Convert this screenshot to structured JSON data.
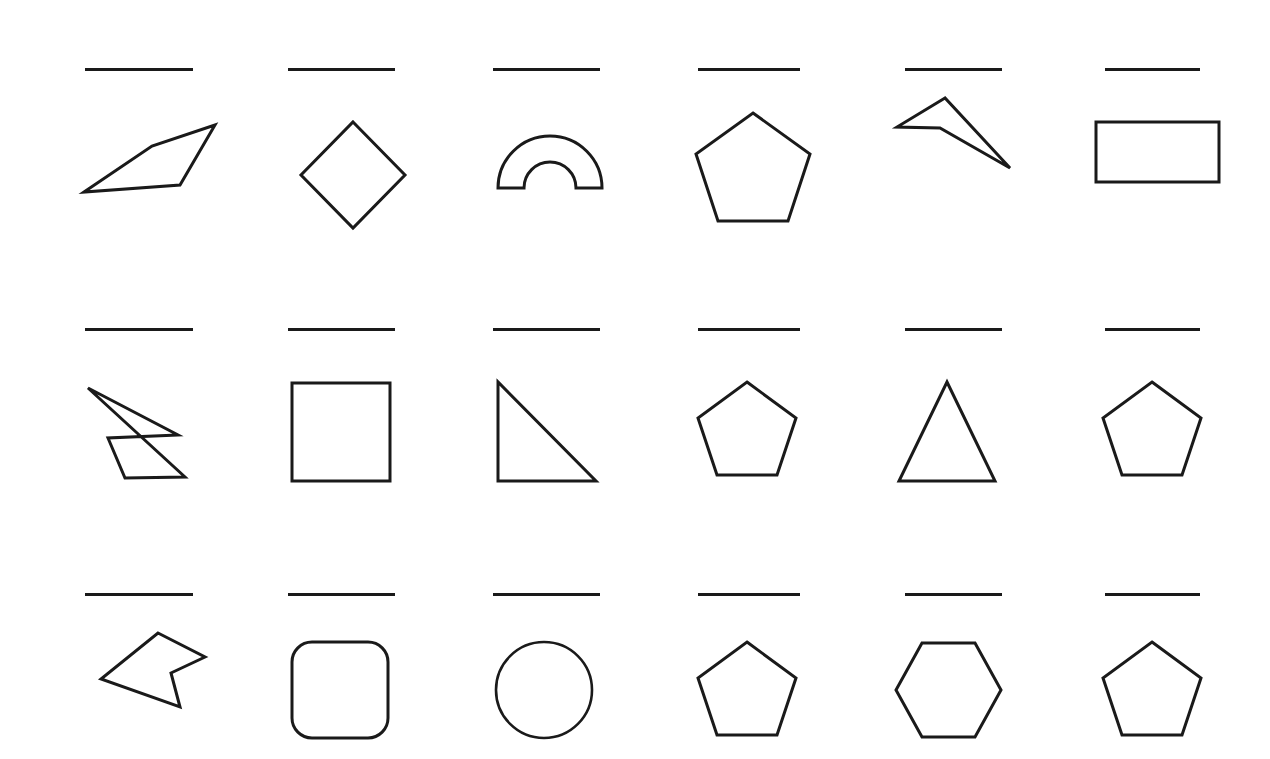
{
  "page": {
    "background_color": "#ffffff",
    "stroke_color": "#1a1a1a",
    "rows": 3,
    "columns": 6,
    "total_cells": 18,
    "rule_label": "horizontal-rule"
  },
  "cells": [
    {
      "index": 1,
      "row": 1,
      "column": 1,
      "shape_name": "irregular-quadrilateral",
      "shape_type": "polygon",
      "sides": 4,
      "convex": true,
      "points": "24,112 92,66 155,45 120,105"
    },
    {
      "index": 2,
      "row": 1,
      "column": 2,
      "shape_name": "diamond-square",
      "shape_type": "polygon",
      "sides": 4,
      "convex": true,
      "points": "88,42 140,95 88,148 36,95"
    },
    {
      "index": 3,
      "row": 1,
      "column": 3,
      "shape_name": "half-annulus-arch",
      "shape_type": "arch",
      "sides": 0,
      "convex": false,
      "points": ""
    },
    {
      "index": 4,
      "row": 1,
      "column": 4,
      "shape_name": "regular-pentagon",
      "shape_type": "polygon",
      "sides": 5,
      "convex": true,
      "points": "83,33 140,74 118,141 48,141 26,74"
    },
    {
      "index": 5,
      "row": 1,
      "column": 5,
      "shape_name": "concave-dart",
      "shape_type": "polygon",
      "sides": 4,
      "convex": false,
      "points": "50,13 2,42 45,43 115,83"
    },
    {
      "index": 6,
      "row": 1,
      "column": 6,
      "shape_name": "rectangle",
      "shape_type": "rect",
      "sides": 4,
      "convex": true,
      "points": "16,40 139,40 139,100 16,100"
    },
    {
      "index": 7,
      "row": 2,
      "column": 1,
      "shape_name": "concave-boat-pentagon",
      "shape_type": "polygon",
      "sides": 5,
      "convex": false,
      "points": "8,12 20,52 34,55 106,59 75,102 30,101"
    },
    {
      "index": 8,
      "row": 2,
      "column": 2,
      "shape_name": "square",
      "shape_type": "rect",
      "sides": 4,
      "convex": true,
      "points": "22,13 120,13 120,111 22,111"
    },
    {
      "index": 9,
      "row": 2,
      "column": 3,
      "shape_name": "right-triangle",
      "shape_type": "polygon",
      "sides": 3,
      "convex": true,
      "points": "23,12 23,111 121,111"
    },
    {
      "index": 10,
      "row": 2,
      "column": 4,
      "shape_name": "regular-pentagon",
      "shape_type": "polygon",
      "sides": 5,
      "convex": true,
      "points": "77,12 126,48 107,105 47,105 28,48"
    },
    {
      "index": 11,
      "row": 2,
      "column": 5,
      "shape_name": "equilateral-triangle",
      "shape_type": "polygon",
      "sides": 3,
      "convex": true,
      "points": "72,12 120,111 24,111"
    },
    {
      "index": 12,
      "row": 2,
      "column": 6,
      "shape_name": "regular-pentagon",
      "shape_type": "polygon",
      "sides": 5,
      "convex": true,
      "points": "77,12 126,48 107,105 47,105 28,48"
    },
    {
      "index": 13,
      "row": 3,
      "column": 1,
      "shape_name": "concave-left-arrow",
      "shape_type": "polygon",
      "sides": 5,
      "convex": false,
      "points": "73,13 120,37 86,53 95,87 16,59"
    },
    {
      "index": 14,
      "row": 3,
      "column": 2,
      "shape_name": "rounded-square",
      "shape_type": "rounded-rect",
      "sides": 4,
      "convex": true,
      "points": "22,12 118,12 118,108 22,108",
      "corner_radius": 20
    },
    {
      "index": 15,
      "row": 3,
      "column": 3,
      "shape_name": "circle",
      "shape_type": "circle",
      "sides": 0,
      "convex": true,
      "points": "",
      "center_x": 72,
      "center_y": 60,
      "radius": 48
    },
    {
      "index": 16,
      "row": 3,
      "column": 4,
      "shape_name": "regular-pentagon",
      "shape_type": "polygon",
      "sides": 5,
      "convex": true,
      "points": "77,12 126,48 107,105 47,105 28,48"
    },
    {
      "index": 17,
      "row": 3,
      "column": 5,
      "shape_name": "regular-hexagon",
      "shape_type": "polygon",
      "sides": 6,
      "convex": true,
      "points": "47,13 100,13 126,60 100,107 47,107 21,60"
    },
    {
      "index": 18,
      "row": 3,
      "column": 6,
      "shape_name": "regular-pentagon",
      "shape_type": "polygon",
      "sides": 5,
      "convex": true,
      "points": "77,12 126,48 107,105 47,105 28,48"
    }
  ],
  "grid_layout": {
    "column_x": [
      60,
      265,
      470,
      670,
      875,
      1080
    ],
    "row_y": [
      50,
      310,
      575
    ],
    "cell_width": 205,
    "cell_height": 230
  }
}
